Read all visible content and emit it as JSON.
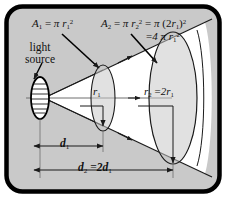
{
  "figure": {
    "frame_color": "#000000",
    "background_color": "#c9c9c9",
    "beam_color": "#ffffff",
    "line_color": "#1a1a1a"
  },
  "labels": {
    "light_source_line1": "light",
    "light_source_line2": "source",
    "area1": "A₁ = π r₁²",
    "area2_part1": "A₂ = π r₂²",
    "area2_part2": "= π (2r₁)²",
    "area2_part3": "= 4 π r₁²",
    "radius1": "r₁",
    "radius2": "r₂ = 2r₁",
    "distance1": "d₁",
    "distance2": "d₂ = 2d₁"
  },
  "parts": {
    "A1_A": "A",
    "A1_sub": "1",
    "A1_eq": "=",
    "pi": "π",
    "r": "r",
    "sub1": "1",
    "sub2": "2",
    "sup2": "2",
    "A2_A": "A",
    "two": "2",
    "d": "d",
    "eq": "=",
    "lparen": "(",
    "rparen": ")",
    "four": "4"
  },
  "geometry": {
    "source_x": 40,
    "source_y": 98,
    "ellipse1_cx": 103,
    "ellipse1_cy": 98,
    "ellipse1_rx": 12,
    "ellipse1_ry": 33,
    "ellipse2_cx": 173,
    "ellipse2_cy": 98,
    "ellipse2_rx": 24,
    "ellipse2_ry": 66,
    "d1_label_value": "d1 spans source to first screen",
    "d2_label_value": "d2 spans source to second screen"
  }
}
